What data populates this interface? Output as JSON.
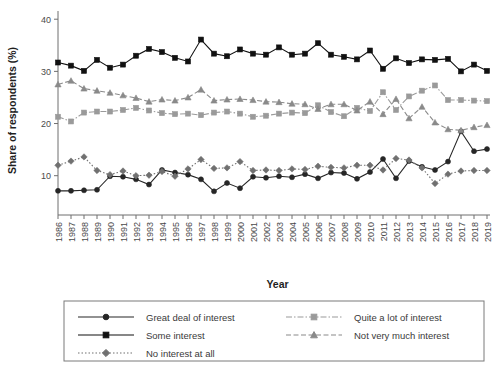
{
  "chart_data": {
    "type": "line",
    "title": "",
    "xlabel": "Year",
    "ylabel": "Share of respondents (%)",
    "xlim": [
      1986,
      2019
    ],
    "ylim": [
      4,
      41
    ],
    "yticks": [
      10,
      20,
      30,
      40
    ],
    "ytick_labels": [
      "10",
      "20",
      "30",
      "40"
    ],
    "grid": false,
    "legend_position": "bottom",
    "categories": [
      1986,
      1987,
      1988,
      1989,
      1990,
      1991,
      1992,
      1993,
      1994,
      1995,
      1996,
      1997,
      1998,
      1999,
      2000,
      2001,
      2002,
      2003,
      2004,
      2005,
      2006,
      2007,
      2008,
      2009,
      2010,
      2011,
      2012,
      2013,
      2014,
      2015,
      2016,
      2017,
      2018,
      2019
    ],
    "xtick_labels": [
      "1986",
      "1987",
      "1988",
      "1989",
      "1990",
      "1991",
      "1992",
      "1993",
      "1994",
      "1995",
      "1996",
      "1997",
      "1998",
      "1999",
      "2000",
      "2001",
      "2002",
      "2003",
      "2004",
      "2005",
      "2006",
      "2007",
      "2008",
      "2009",
      "2010",
      "2011",
      "2012",
      "2013",
      "2014",
      "2015",
      "2016",
      "2017",
      "2018",
      "2019"
    ],
    "series": [
      {
        "name": "Great deal of interest",
        "marker": "circle",
        "dash": "none",
        "color": "#262626",
        "values": [
          7.1,
          7.1,
          7.2,
          7.3,
          9.9,
          9.8,
          9.3,
          8.3,
          11.1,
          10.6,
          10.2,
          9.3,
          7.0,
          8.6,
          7.6,
          9.8,
          9.6,
          9.9,
          9.7,
          10.3,
          9.5,
          10.6,
          10.5,
          9.4,
          10.7,
          13.2,
          9.5,
          12.8,
          11.7,
          11.1,
          12.7,
          18.5,
          14.7,
          15.1
        ]
      },
      {
        "name": "Some interest",
        "marker": "square",
        "dash": "none",
        "color": "#111111",
        "values": [
          31.7,
          31.1,
          30.1,
          32.2,
          30.7,
          31.3,
          33.0,
          34.3,
          33.7,
          32.6,
          31.9,
          36.1,
          33.4,
          32.9,
          34.2,
          33.4,
          33.2,
          34.6,
          33.2,
          33.4,
          35.4,
          33.2,
          32.8,
          32.3,
          34.0,
          30.5,
          32.5,
          31.6,
          32.3,
          32.2,
          32.4,
          30.0,
          31.3,
          30.1
        ]
      },
      {
        "name": "Quite a lot of interest",
        "marker": "square",
        "dash": "dashdot",
        "color": "#9a9a9a",
        "values": [
          21.3,
          20.4,
          22.1,
          22.3,
          22.3,
          22.6,
          23.0,
          22.5,
          22.0,
          21.8,
          21.9,
          21.6,
          22.1,
          22.3,
          21.9,
          21.3,
          21.5,
          21.9,
          22.1,
          22.0,
          23.5,
          22.2,
          21.4,
          23.0,
          22.4,
          26.0,
          22.6,
          25.2,
          26.3,
          27.3,
          24.5,
          24.5,
          24.4,
          24.3
        ]
      },
      {
        "name": "Not very much interest",
        "marker": "triangle",
        "dash": "dashed",
        "color": "#8a8a8a",
        "values": [
          27.5,
          28.2,
          26.7,
          26.3,
          25.9,
          25.4,
          24.9,
          24.2,
          24.6,
          24.4,
          25.0,
          26.5,
          24.4,
          24.6,
          24.7,
          24.5,
          24.2,
          24.1,
          23.8,
          23.7,
          22.8,
          23.7,
          23.7,
          22.5,
          24.2,
          21.8,
          24.7,
          21.0,
          23.2,
          20.2,
          18.9,
          18.7,
          19.3,
          19.7
        ]
      },
      {
        "name": "No interest at all",
        "marker": "diamond",
        "dash": "dotted",
        "color": "#707070",
        "values": [
          12.0,
          12.8,
          13.6,
          11.0,
          10.2,
          10.9,
          10.0,
          10.1,
          10.8,
          9.9,
          11.3,
          13.1,
          11.4,
          11.5,
          12.7,
          11.0,
          11.1,
          11.0,
          11.3,
          11.2,
          11.8,
          11.6,
          11.5,
          12.0,
          12.0,
          11.1,
          13.3,
          13.0,
          11.5,
          8.5,
          10.3,
          10.9,
          11.0,
          11.0
        ]
      }
    ],
    "legend_entries": [
      {
        "label": "Great deal of interest",
        "marker": "circle",
        "dash": "none",
        "color": "#262626"
      },
      {
        "label": "Quite a lot of interest",
        "marker": "square",
        "dash": "dashdot",
        "color": "#9a9a9a"
      },
      {
        "label": "Some interest",
        "marker": "square",
        "dash": "none",
        "color": "#111111"
      },
      {
        "label": "Not very much interest",
        "marker": "triangle",
        "dash": "dashed",
        "color": "#8a8a8a"
      },
      {
        "label": "No interest at all",
        "marker": "diamond",
        "dash": "dotted",
        "color": "#707070"
      }
    ]
  }
}
